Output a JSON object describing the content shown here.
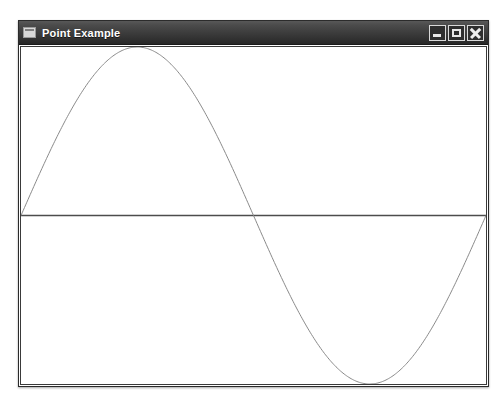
{
  "window": {
    "title": "Point Example",
    "icon": "window-icon",
    "controls": [
      {
        "name": "minimize",
        "label": "Minimize",
        "glyph": "_"
      },
      {
        "name": "maximize",
        "label": "Maximize",
        "glyph": "□"
      },
      {
        "name": "close",
        "label": "Close",
        "glyph": "✕"
      }
    ]
  },
  "colors": {
    "titlebar_dark": "#313131",
    "titlebar_light": "#585858",
    "title_text": "#ffffff",
    "window_border": "#2b2b2b",
    "canvas_background": "#ffffff",
    "axis_line": "#4d4d4d",
    "curve_line": "#8a8a8a"
  },
  "chart_data": {
    "type": "line",
    "title": "",
    "xlabel": "",
    "ylabel": "",
    "grid": false,
    "legend": null,
    "axis": {
      "horizontal_zero_line": true,
      "xlim": [
        0,
        6.283185307179586
      ],
      "ylim": [
        -1,
        1
      ]
    },
    "series": [
      {
        "name": "sine",
        "expression": "sin(x)",
        "stroke": "#8a8a8a",
        "stroke_width": 1,
        "x": [
          0.0,
          0.2,
          0.4,
          0.6,
          0.8,
          1.0,
          1.2,
          1.4,
          1.5708,
          1.8,
          2.0,
          2.2,
          2.4,
          2.6,
          2.8,
          3.0,
          3.1416,
          3.4,
          3.6,
          3.8,
          4.0,
          4.2,
          4.4,
          4.6,
          4.7124,
          5.0,
          5.2,
          5.4,
          5.6,
          5.8,
          6.0,
          6.2,
          6.2832
        ],
        "y": [
          0.0,
          0.199,
          0.389,
          0.565,
          0.717,
          0.841,
          0.932,
          0.985,
          1.0,
          0.974,
          0.909,
          0.808,
          0.675,
          0.516,
          0.335,
          0.141,
          0.0,
          -0.256,
          -0.443,
          -0.612,
          -0.757,
          -0.872,
          -0.952,
          -0.994,
          -1.0,
          -0.959,
          -0.883,
          -0.773,
          -0.631,
          -0.465,
          -0.279,
          -0.083,
          0.0
        ]
      }
    ]
  }
}
